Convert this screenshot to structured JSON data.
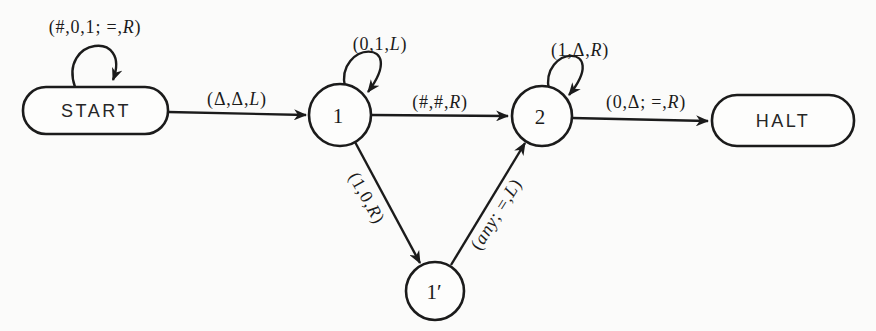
{
  "diagram": {
    "type": "turing-machine-state-diagram",
    "colors": {
      "background": "#fbfbfa",
      "ink": "#1b1b1b"
    },
    "states": [
      {
        "id": "start",
        "label": "START",
        "shape": "rounded-rect"
      },
      {
        "id": "1",
        "label": "1",
        "shape": "circle"
      },
      {
        "id": "2",
        "label": "2",
        "shape": "circle"
      },
      {
        "id": "1-prime",
        "label": "1′",
        "shape": "circle"
      },
      {
        "id": "halt",
        "label": "HALT",
        "shape": "rounded-rect"
      }
    ],
    "transitions": [
      {
        "from": "START",
        "to": "START",
        "label": "(#,0,1; =,R)"
      },
      {
        "from": "START",
        "to": "1",
        "label": "(Δ,Δ,L)"
      },
      {
        "from": "1",
        "to": "1",
        "label": "(0,1,L)"
      },
      {
        "from": "1",
        "to": "2",
        "label": "(#,#,R)"
      },
      {
        "from": "2",
        "to": "2",
        "label": "(1,Δ,R)"
      },
      {
        "from": "2",
        "to": "HALT",
        "label": "(0,Δ; =,R)"
      },
      {
        "from": "1",
        "to": "1′",
        "label": "(1,0,R)"
      },
      {
        "from": "1′",
        "to": "2",
        "label": "(any; =,L)"
      }
    ]
  }
}
